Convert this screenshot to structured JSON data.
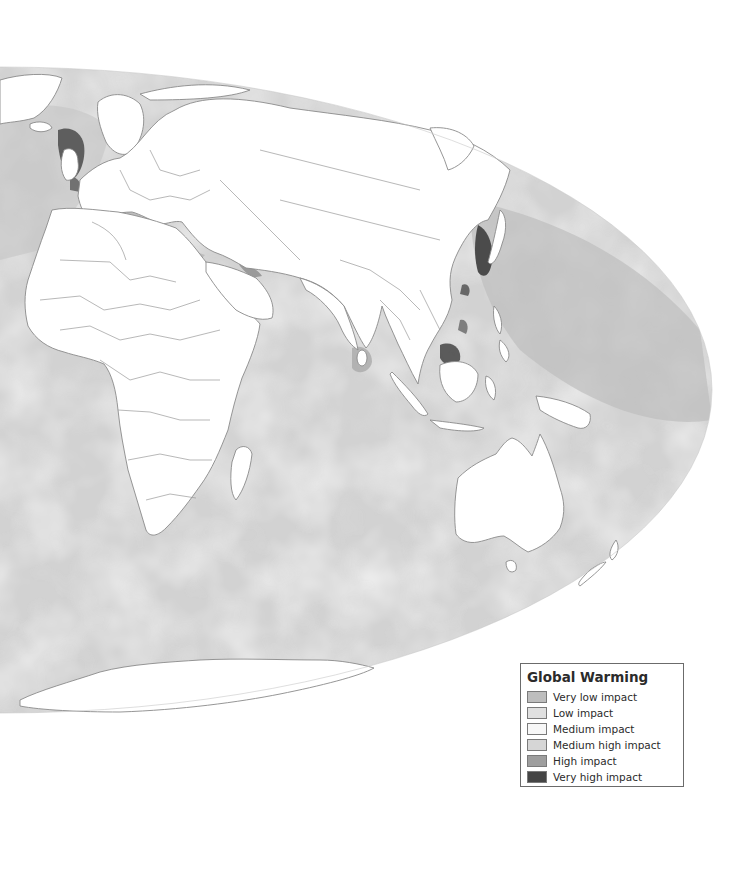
{
  "map": {
    "projection": "elliptical world map (Eastern Hemisphere view)",
    "ocean_base_color": "#d4d4d4",
    "land_color": "#ffffff",
    "border_color": "#8a8a8a",
    "regions_shown": [
      "Greenland",
      "Europe",
      "Africa",
      "Middle East",
      "Asia",
      "Indian Ocean",
      "Southeast Asia",
      "Australia",
      "New Zealand",
      "Antarctica",
      "Pacific Ocean (western)"
    ]
  },
  "legend": {
    "title": "Global Warming",
    "items": [
      {
        "label": "Very low impact",
        "color": "#bdbdbd"
      },
      {
        "label": "Low impact",
        "color": "#e0e0e0"
      },
      {
        "label": "Medium impact",
        "color": "#f7f7f7"
      },
      {
        "label": "Medium high impact",
        "color": "#d6d6d6"
      },
      {
        "label": "High impact",
        "color": "#9e9e9e"
      },
      {
        "label": "Very high impact",
        "color": "#454545"
      }
    ]
  }
}
